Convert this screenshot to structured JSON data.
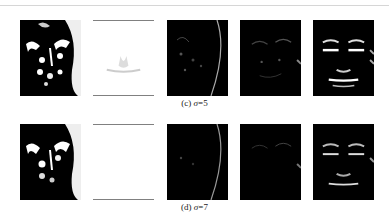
{
  "figure": {
    "rows": [
      {
        "label": "(c)",
        "sigma_symbol": "σ",
        "sigma_value": "=5",
        "caption": "(c) σ=5",
        "panels": [
          {
            "style": "high-contrast-texture"
          },
          {
            "style": "bright-mask"
          },
          {
            "style": "faint-edges"
          },
          {
            "style": "faint-edges-2"
          },
          {
            "style": "horizontal-features"
          }
        ]
      },
      {
        "label": "(d)",
        "sigma_symbol": "σ",
        "sigma_value": "=7",
        "caption": "(d) σ=7",
        "panels": [
          {
            "style": "high-contrast-texture"
          },
          {
            "style": "bright-mask"
          },
          {
            "style": "faint-edges"
          },
          {
            "style": "faint-edges-2"
          },
          {
            "style": "horizontal-features"
          }
        ]
      }
    ]
  }
}
